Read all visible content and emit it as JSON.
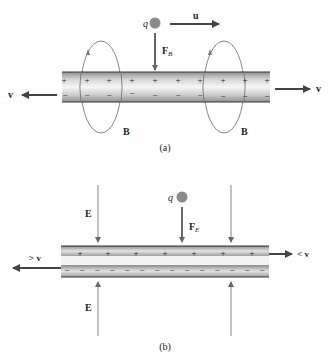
{
  "panel_a": {
    "caption": "(a)",
    "charge_label": "q",
    "velocity_label": "u",
    "force_label": "F",
    "force_subscript": "B",
    "field_label_left": "B",
    "field_label_right": "B",
    "left_velocity_label": "v",
    "right_velocity_label": "v",
    "plus_sign": "+",
    "minus_sign": "−",
    "plus_count": 10,
    "minus_count": 10
  },
  "panel_b": {
    "caption": "(b)",
    "charge_label": "q",
    "force_label": "F",
    "force_subscript": "E",
    "field_label_top": "E",
    "field_label_bottom": "E",
    "left_velocity_label": "> v",
    "right_velocity_label": "< v",
    "plus_sign": "+",
    "minus_sign": "−",
    "plus_count": 7,
    "minus_count": 14
  },
  "colors": {
    "arrow": "#555555",
    "charge": "#8a8a8a",
    "rod_light": "#f4f4f4",
    "rod_dark": "#9a9a9a",
    "edge": "#333333",
    "field_line": "#777777"
  }
}
